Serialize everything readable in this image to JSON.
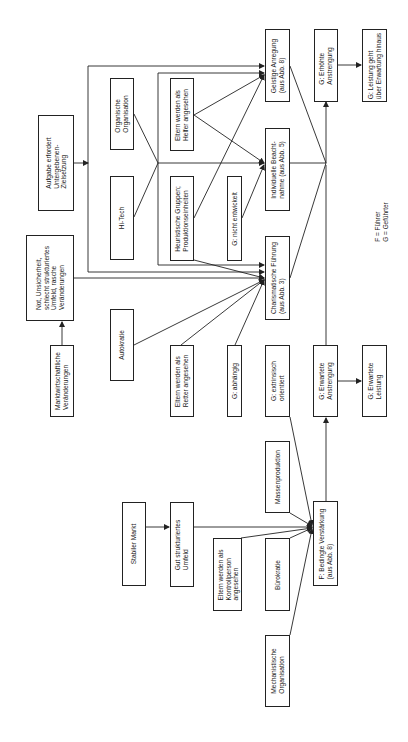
{
  "diagram": {
    "orientation": "rotated 90 degrees counter-clockwise (text reads bottom-to-top)",
    "nodes": [
      {
        "id": "aufgabe",
        "label": "Aufgabe erfordert\nUntergebenen-\nZielsetzung"
      },
      {
        "id": "not",
        "label": "Not, Unsicherheit,\nschlecht strukturiertes\nUmfeld, rasche\nVeränderungen"
      },
      {
        "id": "markt",
        "label": "Marktwirtschaftliche\nVeränderungen"
      },
      {
        "id": "organische",
        "label": "Organische\nOrganisation"
      },
      {
        "id": "hitech",
        "label": "Hi-Tech"
      },
      {
        "id": "autokratie",
        "label": "Autokratie"
      },
      {
        "id": "helfer",
        "label": "Eltern werden als\nHelfer angesehen"
      },
      {
        "id": "heuristische",
        "label": "Heuristische Gruppen;\nProduktionseinheiten"
      },
      {
        "id": "retter",
        "label": "Eltern werden als\nRetter angesehen"
      },
      {
        "id": "nichtentwickelt",
        "label": "G: nicht entwickelt"
      },
      {
        "id": "abhaengig",
        "label": "G: abhängig"
      },
      {
        "id": "geistige",
        "label": "Geistige Anregung\n(aus Abb. 8)"
      },
      {
        "id": "individuelle",
        "label": "Individuelle Beacht-\nnahme (aus Abb. 5)"
      },
      {
        "id": "charismatische",
        "label": "Charismatische Führung\n(aus Abb. 3)"
      },
      {
        "id": "extrinsisch",
        "label": "G: extrinsisch\norientiert"
      },
      {
        "id": "erhoehte",
        "label": "G: Erhöhte\nAnstrengung"
      },
      {
        "id": "erwarteteAnstr",
        "label": "G: Erwartete\nAnstrengung"
      },
      {
        "id": "leistungGeht",
        "label": "G: Leistung geht\nüber Erwartung hinaus"
      },
      {
        "id": "erwarteteLeistung",
        "label": "G: Erwartete\nLeistung"
      },
      {
        "id": "stabiler",
        "label": "Stabiler Markt"
      },
      {
        "id": "gutstrukturiert",
        "label": "Gut strukturiertes\nUmfeld"
      },
      {
        "id": "kontrollperson",
        "label": "Eltern werden als\nKontrollperson\nangesehen"
      },
      {
        "id": "massenproduktion",
        "label": "Massenproduktion"
      },
      {
        "id": "buerokratie",
        "label": "Bürokratie"
      },
      {
        "id": "bedingte",
        "label": "F: Bedingte Verstärkung\n(aus Abb. 8)"
      },
      {
        "id": "mechanistische",
        "label": "Mechanistische\nOrganisation"
      }
    ],
    "edges": [
      [
        "markt",
        "not"
      ],
      [
        "not",
        "charismatische"
      ],
      [
        "aufgabe",
        "geistige"
      ],
      [
        "aufgabe",
        "individuelle"
      ],
      [
        "aufgabe",
        "charismatische"
      ],
      [
        "organische",
        "individuelle"
      ],
      [
        "hitech",
        "individuelle"
      ],
      [
        "helfer",
        "geistige"
      ],
      [
        "helfer",
        "individuelle"
      ],
      [
        "heuristische",
        "geistige"
      ],
      [
        "heuristische",
        "charismatische"
      ],
      [
        "nichtentwickelt",
        "individuelle"
      ],
      [
        "autokratie",
        "charismatische"
      ],
      [
        "retter",
        "charismatische"
      ],
      [
        "abhaengig",
        "charismatische"
      ],
      [
        "geistige",
        "erhoehte"
      ],
      [
        "individuelle",
        "erhoehte"
      ],
      [
        "charismatische",
        "erhoehte"
      ],
      [
        "erwarteteAnstr",
        "erhoehte"
      ],
      [
        "erhoehte",
        "leistungGeht"
      ],
      [
        "erwarteteAnstr",
        "erwarteteLeistung"
      ],
      [
        "stabiler",
        "gutstrukturiert"
      ],
      [
        "gutstrukturiert",
        "bedingte"
      ],
      [
        "kontrollperson",
        "bedingte"
      ],
      [
        "massenproduktion",
        "bedingte"
      ],
      [
        "buerokratie",
        "bedingte"
      ],
      [
        "mechanistische",
        "bedingte"
      ],
      [
        "extrinsisch",
        "bedingte"
      ],
      [
        "bedingte",
        "erwarteteAnstr"
      ]
    ],
    "legend": "F = Führer\nG = Geführter"
  }
}
